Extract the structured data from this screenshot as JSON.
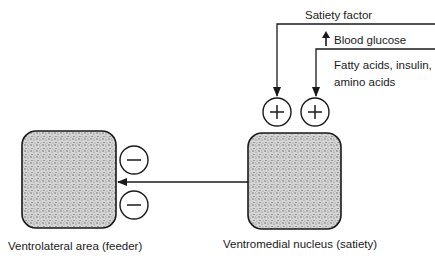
{
  "diagram": {
    "nodes": {
      "feeder": {
        "label": "Ventrolateral area (feeder)"
      },
      "satiety": {
        "label": "Ventromedial nucleus (satiety)"
      }
    },
    "inputs": {
      "satiety_factor": "Satiety factor",
      "blood_glucose": "Blood glucose",
      "fatty_acids_line1": "Fatty acids, insulin,",
      "fatty_acids_line2": "amino acids"
    },
    "signs": {
      "plus": "+",
      "minus": "−"
    },
    "colors": {
      "stroke": "#1a1a1a",
      "fill": "#bdbdbd"
    }
  }
}
